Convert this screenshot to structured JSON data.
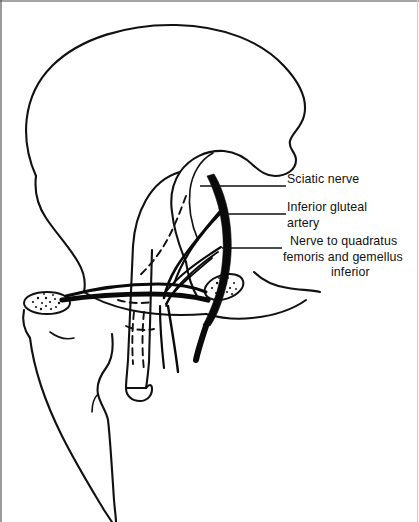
{
  "figure": {
    "kind": "anatomical-line-drawing",
    "background_color": "#ffffff",
    "ink_color": "#111111",
    "width": 419,
    "height": 522
  },
  "labels": [
    {
      "id": "sciatic-nerve",
      "lines": [
        "Sciatic nerve"
      ],
      "text": "Sciatic nerve",
      "x": 287,
      "y": 179
    },
    {
      "id": "inferior-gluteal-artery",
      "lines": [
        "Inferior gluteal",
        "artery"
      ],
      "line1": "Inferior gluteal",
      "line2": "artery",
      "x": 287,
      "y": 207
    },
    {
      "id": "nerve-to-quadratus-femoris",
      "lines": [
        "Nerve to quadratus",
        "femoris and gemellus",
        "inferior"
      ],
      "line1": "Nerve to quadratus",
      "line2": "femoris and gemellus",
      "line3": "inferior",
      "x": 283,
      "y": 241
    }
  ],
  "leader_lines": [
    {
      "id": "leader-sciatic-nerve",
      "x1": 200,
      "y1": 186,
      "x2": 286,
      "y2": 186
    },
    {
      "id": "leader-inferior-gluteal-artery",
      "x1": 224,
      "y1": 214,
      "x2": 286,
      "y2": 214
    },
    {
      "id": "leader-nerve-quadratus-femoris",
      "x1": 222,
      "y1": 248,
      "x2": 282,
      "y2": 248
    }
  ],
  "structures": [
    {
      "id": "ilium-iliac-crest",
      "name": "Ilium / iliac crest"
    },
    {
      "id": "greater-trochanter",
      "name": "Greater trochanter"
    },
    {
      "id": "femoral-shaft",
      "name": "Femoral shaft"
    },
    {
      "id": "ischial-tuberosity",
      "name": "Ischial tuberosity"
    },
    {
      "id": "pubic-symphysis",
      "name": "Pubic symphysis region"
    },
    {
      "id": "sciatic-nerve-band",
      "name": "Sciatic nerve"
    },
    {
      "id": "inferior-gluteal-artery-vessel",
      "name": "Inferior gluteal artery"
    },
    {
      "id": "nerve-to-quadratus-femoris-branch",
      "name": "Nerve to quadratus femoris and gemellus inferior"
    }
  ]
}
